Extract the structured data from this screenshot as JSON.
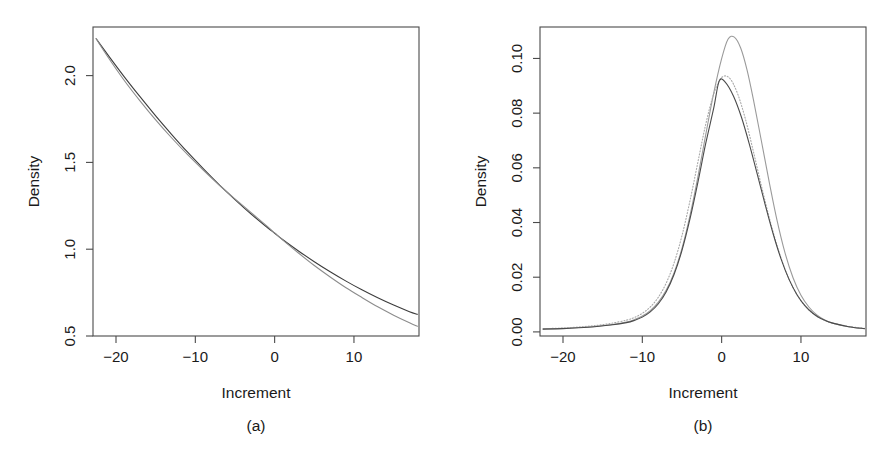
{
  "figure": {
    "caption_a": "(a)",
    "caption_b": "(b)",
    "background": "#ffffff",
    "foreground": "#1a1a1a"
  },
  "chart_data": [
    {
      "panel": "a",
      "type": "line",
      "title": "",
      "xlabel": "Increment",
      "ylabel": "Density",
      "caption": "(a)",
      "xlim": [
        -22.9,
        18.2
      ],
      "ylim": [
        0.5,
        2.28
      ],
      "xticks": [
        -20,
        -10,
        0,
        10
      ],
      "xticklabels": [
        "-20",
        "-10",
        "0",
        "10"
      ],
      "yticks": [
        0.5,
        1.0,
        1.5,
        2.0
      ],
      "yticklabels": [
        "0.5",
        "1.0",
        "1.5",
        "2.0"
      ],
      "grid": false,
      "legend": "none",
      "series": [
        {
          "name": "curve-1",
          "style": "solid",
          "color": "#3c3c3c",
          "width": 1.1,
          "x": [
            -22.5,
            -21.0,
            -19.0,
            -17.0,
            -15.0,
            -13.0,
            -11.0,
            -9.0,
            -7.0,
            -5.0,
            -3.0,
            -1.0,
            0.0,
            1.0,
            3.0,
            5.0,
            7.0,
            9.0,
            11.0,
            13.0,
            15.0,
            17.0,
            18.0
          ],
          "y": [
            2.212,
            2.118,
            1.996,
            1.88,
            1.768,
            1.662,
            1.56,
            1.464,
            1.372,
            1.286,
            1.204,
            1.128,
            1.092,
            1.056,
            0.99,
            0.928,
            0.87,
            0.816,
            0.766,
            0.72,
            0.678,
            0.64,
            0.625
          ]
        },
        {
          "name": "curve-2",
          "style": "solid",
          "color": "#8c8c8c",
          "width": 1.1,
          "x": [
            -22.5,
            -21.0,
            -19.0,
            -17.0,
            -15.0,
            -13.0,
            -11.0,
            -9.0,
            -7.0,
            -5.0,
            -3.0,
            -1.0,
            0.0,
            1.0,
            3.0,
            5.0,
            7.0,
            9.0,
            11.0,
            13.0,
            15.0,
            17.0,
            18.0
          ],
          "y": [
            2.212,
            2.106,
            1.975,
            1.856,
            1.745,
            1.642,
            1.546,
            1.456,
            1.37,
            1.29,
            1.212,
            1.134,
            1.094,
            1.054,
            0.978,
            0.906,
            0.84,
            0.778,
            0.722,
            0.668,
            0.62,
            0.576,
            0.556
          ]
        }
      ]
    },
    {
      "panel": "b",
      "type": "line",
      "title": "",
      "xlabel": "Increment",
      "ylabel": "Density",
      "caption": "(b)",
      "xlim": [
        -22.9,
        18.2
      ],
      "ylim": [
        -0.0015,
        0.1115
      ],
      "xticks": [
        -20,
        -10,
        0,
        10
      ],
      "xticklabels": [
        "-20",
        "-10",
        "0",
        "10"
      ],
      "yticks": [
        0.0,
        0.02,
        0.04,
        0.06,
        0.08,
        0.1
      ],
      "yticklabels": [
        "0.00",
        "0.02",
        "0.04",
        "0.06",
        "0.08",
        "0.10"
      ],
      "grid": false,
      "legend": "none",
      "series": [
        {
          "name": "tall-peak-solid",
          "style": "solid",
          "color": "#9a9a9a",
          "width": 1.1,
          "peak_x": 0.8,
          "peak_y": 0.1078,
          "x": [
            -22.5,
            -20.0,
            -18.0,
            -16.0,
            -14.0,
            -12.0,
            -11.0,
            -10.0,
            -9.0,
            -8.0,
            -7.0,
            -6.0,
            -5.0,
            -4.0,
            -3.0,
            -2.0,
            -1.0,
            0.0,
            0.8,
            1.6,
            2.4,
            3.2,
            4.0,
            5.0,
            6.0,
            7.0,
            8.0,
            9.0,
            10.0,
            11.0,
            12.0,
            13.0,
            14.0,
            16.0,
            18.0
          ],
          "y": [
            0.0011,
            0.0013,
            0.0016,
            0.002,
            0.0026,
            0.0036,
            0.0045,
            0.0058,
            0.0078,
            0.0108,
            0.0152,
            0.0216,
            0.0305,
            0.0424,
            0.0566,
            0.0722,
            0.0873,
            0.0999,
            0.107,
            0.1078,
            0.1038,
            0.0958,
            0.085,
            0.07,
            0.0548,
            0.0406,
            0.0288,
            0.0198,
            0.0134,
            0.0091,
            0.0062,
            0.0044,
            0.0032,
            0.0019,
            0.0012
          ]
        },
        {
          "name": "dotted-curve",
          "style": "dotted",
          "color": "#a8a8a8",
          "width": 1.1,
          "peak_x": 0.0,
          "peak_y": 0.093,
          "x": [
            -22.5,
            -20.0,
            -18.0,
            -16.0,
            -14.0,
            -12.0,
            -11.0,
            -10.0,
            -9.0,
            -8.0,
            -7.0,
            -6.0,
            -5.0,
            -4.0,
            -3.0,
            -2.0,
            -1.0,
            0.0,
            1.0,
            2.0,
            3.0,
            4.0,
            5.0,
            6.0,
            7.0,
            8.0,
            9.0,
            10.0,
            11.0,
            12.0,
            13.0,
            14.0,
            16.0,
            18.0
          ],
          "y": [
            0.0012,
            0.0014,
            0.0018,
            0.0023,
            0.0031,
            0.0043,
            0.0053,
            0.0068,
            0.0091,
            0.0126,
            0.0178,
            0.0252,
            0.0352,
            0.0478,
            0.062,
            0.076,
            0.087,
            0.093,
            0.0928,
            0.0872,
            0.0778,
            0.066,
            0.0536,
            0.0418,
            0.0314,
            0.0228,
            0.0162,
            0.0114,
            0.008,
            0.0057,
            0.0042,
            0.0032,
            0.002,
            0.0013
          ]
        },
        {
          "name": "low-peak-solid",
          "style": "solid",
          "color": "#4a4a4a",
          "width": 1.1,
          "peak_x": -0.3,
          "peak_y": 0.0918,
          "x": [
            -22.5,
            -20.0,
            -18.0,
            -16.0,
            -14.0,
            -12.0,
            -11.0,
            -10.0,
            -9.0,
            -8.0,
            -7.0,
            -6.0,
            -5.0,
            -4.0,
            -3.0,
            -2.0,
            -1.0,
            -0.3,
            0.5,
            1.5,
            2.5,
            3.5,
            4.5,
            5.5,
            6.5,
            7.5,
            8.5,
            9.5,
            10.5,
            11.5,
            12.5,
            14.0,
            16.0,
            18.0
          ],
          "y": [
            0.001,
            0.0012,
            0.0015,
            0.0019,
            0.0025,
            0.0034,
            0.0042,
            0.0054,
            0.0073,
            0.0102,
            0.0146,
            0.021,
            0.0298,
            0.0412,
            0.0546,
            0.069,
            0.0818,
            0.0918,
            0.0912,
            0.0862,
            0.0785,
            0.0686,
            0.0576,
            0.0464,
            0.0358,
            0.0266,
            0.0192,
            0.0136,
            0.0096,
            0.0068,
            0.0049,
            0.0032,
            0.0019,
            0.0012
          ]
        }
      ]
    }
  ]
}
